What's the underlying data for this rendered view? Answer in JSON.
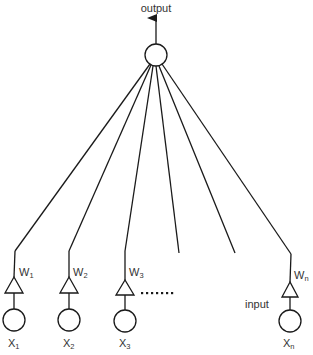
{
  "diagram": {
    "output_label": "output",
    "input_label": "input",
    "ellipsis": "·······",
    "output_node": {
      "cx": 156,
      "cy": 55,
      "r": 11
    },
    "inputs": [
      {
        "id": "x1",
        "x_main": "X",
        "x_sub": "1",
        "w_main": "W",
        "w_sub": "1",
        "col": 14,
        "bend_y": 251
      },
      {
        "id": "x2",
        "x_main": "X",
        "x_sub": "2",
        "w_main": "W",
        "w_sub": "2",
        "col": 69,
        "bend_y": 251
      },
      {
        "id": "x3",
        "x_main": "X",
        "x_sub": "3",
        "w_main": "W",
        "w_sub": "3",
        "col": 125,
        "bend_y": 251
      },
      {
        "id": "xn",
        "x_main": "X",
        "x_sub": "n",
        "w_main": "W",
        "w_sub": "n",
        "col": 290,
        "bend_y": 254
      }
    ],
    "dangling_connections": [
      {
        "end_x": 179,
        "end_y": 253
      },
      {
        "end_x": 235,
        "end_y": 253
      }
    ],
    "colors": {
      "line": "#1a1a1a",
      "text": "#333333",
      "background": "#ffffff"
    }
  }
}
